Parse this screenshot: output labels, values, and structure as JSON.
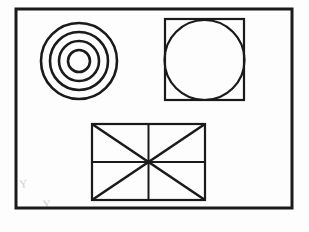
{
  "canvas": {
    "width": 309,
    "height": 232,
    "background_color": "#fdfdfd",
    "stroke_color": "#1a1a1a",
    "faint_mark_color": "#cfcfcf",
    "title": "Geometric Shapes Technical Drawing"
  },
  "frame": {
    "name": "outer-border-frame",
    "x": 16,
    "y": 9,
    "width": 276,
    "height": 199,
    "stroke_width": 3,
    "fill": "none",
    "label": "Outer border frame"
  },
  "shapes": [
    {
      "id": "concentric-circles",
      "label": "Concentric circles",
      "type": "concentric-circles",
      "center_x": 79,
      "center_y": 61,
      "radii": [
        38,
        29,
        20,
        11
      ],
      "ring_count": 4,
      "stroke_width": 2.6,
      "fill": "none"
    },
    {
      "id": "square-with-inscribed-circle",
      "label": "Square with inscribed circle",
      "type": "square-with-inscribed-circle",
      "square": {
        "x": 165,
        "y": 19,
        "width": 79,
        "height": 81,
        "stroke_width": 2.2
      },
      "circle": {
        "center_x": 204.5,
        "center_y": 60,
        "radius": 40,
        "stroke_width": 2.2
      }
    },
    {
      "id": "rectangle-with-diagonals",
      "label": "Rectangle with diagonals and center cross",
      "type": "rectangle-with-diagonals",
      "rect": {
        "x": 92,
        "y": 124,
        "width": 113,
        "height": 76,
        "stroke_width": 2.2
      },
      "internal_lines": [
        {
          "name": "diagonal-top-left-to-bottom-right",
          "x1": 92,
          "y1": 124,
          "x2": 205,
          "y2": 200,
          "stroke_width": 2.6
        },
        {
          "name": "diagonal-bottom-left-to-top-right",
          "x1": 92,
          "y1": 200,
          "x2": 205,
          "y2": 124,
          "stroke_width": 2.6
        },
        {
          "name": "vertical-center-line",
          "x1": 148.5,
          "y1": 124,
          "x2": 148.5,
          "y2": 200,
          "stroke_width": 2.0
        },
        {
          "name": "horizontal-center-line",
          "x1": 92,
          "y1": 162,
          "x2": 205,
          "y2": 162,
          "stroke_width": 2.0
        }
      ]
    }
  ],
  "faint_marks": [
    {
      "id": "pencil-mark-left",
      "glyph": "Y",
      "x": 20,
      "y": 188,
      "rotation": -8,
      "font_size": 11
    },
    {
      "id": "pencil-mark-bottom",
      "glyph": "Y",
      "x": 43,
      "y": 208,
      "rotation": -4,
      "font_size": 11
    }
  ]
}
